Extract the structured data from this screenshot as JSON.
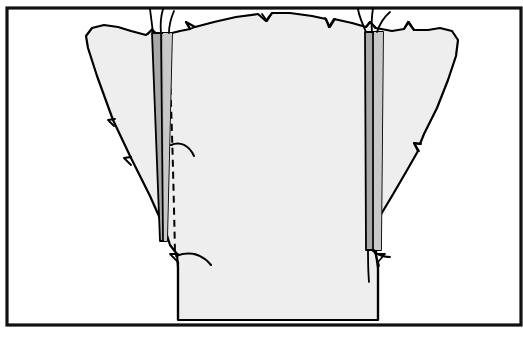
{
  "figure": {
    "domain": "Diagram",
    "kind": "line-art-illustration",
    "title": "",
    "caption": "",
    "width": 523,
    "height": 337,
    "background_color": "#ffffff"
  },
  "colors": {
    "page_background": "#ffffff",
    "frame_stroke": "#111111",
    "outline_stroke": "#000000",
    "body_fill": "#eeeeee",
    "band_fill": "#a8a8a8",
    "band_highlight_fill": "#c9c9c9",
    "dashed_stroke": "#000000",
    "thread_stroke": "#000000"
  },
  "frame": {
    "name": "illustration-border",
    "x": 7,
    "y": 8,
    "width": 514,
    "height": 317,
    "stroke_width": 3.2
  },
  "shapes": {
    "body": {
      "label": "specimen-body",
      "description": "Large irregular winged outline with a rectangular stem at the bottom, filled light grey, drawn with a hand-inked black contour containing small V-notches.",
      "fill": "#eeeeee",
      "stroke": "#000000",
      "stroke_width": 2.2,
      "path": "M 178 320 L 178 268 L 177 254 L 170 245 L 166 232 L 150 196 L 131 158 L 113 120 L 97 76 L 88 48 L 86 36 L 92 28 L 104 25 L 118 27 L 131 31 L 146 35 L 152 30 L 158 35 L 168 34 L 180 31 L 190 29 L 186 22 L 195 27 L 214 22 L 236 17 L 258 14 L 266 21 L 272 13 L 290 13 L 312 16 L 326 19 L 329 27 L 334 19 L 352 23 L 366 27 L 370 22 L 376 28 L 392 31 L 404 29 L 408 22 L 414 30 L 428 30 L 440 28 L 452 31 L 458 40 L 456 56 L 448 80 L 437 108 L 424 134 L 420 144 L 414 143 L 418 151 L 406 172 L 392 196 L 380 216 L 377 229 L 371 230 L 376 236 L 376 254 L 378 268 L 378 320 Z"
    },
    "notch_marks": {
      "label": "contour-notches",
      "description": "Small inked V shaped tick marks along the outline",
      "stroke": "#000000",
      "stroke_width": 1.8,
      "marks": [
        "M 186 22 L 190 29 L 194 27",
        "M 263 13 L 267 21 L 271 13",
        "M 325 18 L 330 27 L 335 19",
        "M 366 27 L 370 22 L 374 28",
        "M 404 29 L 409 22 L 413 30",
        "M 420 144 L 415 143 L 419 151",
        "M 377 229 L 371 230 L 376 237",
        "M 148 34 L 152 29 L 157 35",
        "M 115 119 L 108 120 L 114 126",
        "M 131 157 L 124 158 L 131 165",
        "M 177 255 L 170 255 L 177 262",
        "M 377 255 L 384 255 L 377 262"
      ]
    },
    "stem_left_edge": {
      "label": "stem-left-edge",
      "path": "M 178 268 L 178 320"
    },
    "stem_right_edge": {
      "label": "stem-right-edge",
      "path": "M 378 268 L 378 320"
    },
    "stem_bottom": {
      "label": "stem-bottom-edge",
      "path": "M 178 320 L 378 320"
    }
  },
  "bands": {
    "left": {
      "label": "left-graft-strip",
      "description": "Narrow vertical grey strip running from the upper contour down into the body, slightly slanted, split by an inner line.",
      "fill": "#a8a8a8",
      "stroke": "#000000",
      "stroke_width": 1.8,
      "outer_path": "M 152 33 L 172 33 L 167 241 L 160 241 Z",
      "divider_path": "M 161 33 L 163 241",
      "inner_highlight_path": "M 163 33 L 172 33 L 167 241 L 164 241 Z",
      "threads": [
        "M 153 33 C 152 24 151 18 150 10",
        "M 160 33 C 160 23 161 17 163 9",
        "M 168 33 C 168 24 170 18 173 11"
      ]
    },
    "right": {
      "label": "right-graft-strip",
      "description": "Narrow vertical grey strip on the right side running from the upper contour down to about two thirds of the figure height, with suture threads at both ends.",
      "fill": "#a8a8a8",
      "stroke": "#000000",
      "stroke_width": 1.8,
      "outer_path": "M 365 32 L 383 32 L 381 250 L 366 250 Z",
      "divider_path": "M 373 32 L 373 250",
      "inner_highlight_path": "M 374 32 L 383 32 L 381 250 L 374 250 Z",
      "threads_top": [
        "M 366 32 C 362 23 359 17 358 10",
        "M 372 32 C 371 22 372 16 373 9",
        "M 376 32 C 379 23 383 17 389 12"
      ],
      "threads_bottom": [
        "M 371 250 C 375 255 381 258 389 258",
        "M 373 250 C 375 256 377 261 378 266",
        "M 368 250 C 368 258 368 268 369 280"
      ]
    }
  },
  "dashed_line": {
    "label": "incision-dashed-line",
    "description": "Vertical dashed line just right of the left strip, marking a planned incision.",
    "stroke": "#000000",
    "stroke_width": 2.0,
    "dash_pattern": "7 5",
    "path": "M 168 40 C 171 90 173 160 175 253"
  },
  "hooks": {
    "upper": {
      "label": "upper-tissue-fold-hook",
      "description": "Small curved ink stroke branching right from the dashed line near the top.",
      "stroke": "#000000",
      "stroke_width": 2.0,
      "path": "M 171 145 C 180 141 189 145 194 156"
    },
    "lower": {
      "label": "lower-tissue-fold-hook",
      "description": "Curved ink stroke branching right from the bottom of the dashed line.",
      "stroke": "#000000",
      "stroke_width": 2.0,
      "path": "M 176 256 C 190 251 202 254 211 265"
    }
  },
  "legend": {
    "entries": []
  },
  "labels": []
}
